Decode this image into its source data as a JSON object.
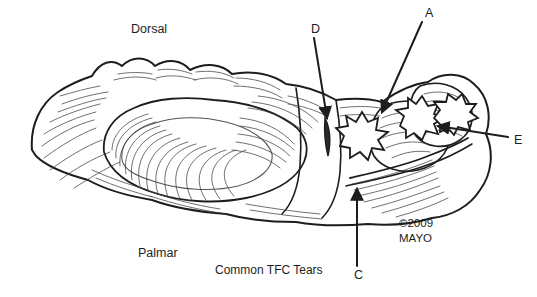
{
  "figure": {
    "kind": "medical-line-illustration",
    "caption": "Common TFC Tears",
    "background_color": "#ffffff",
    "ink_color": "#1d1d1d",
    "rule_color": "#9a9a9a"
  },
  "orientation_labels": [
    {
      "id": "dorsal",
      "text": "Dorsal",
      "x": 131,
      "y": 29
    },
    {
      "id": "palmar",
      "text": "Palmar",
      "x": 138,
      "y": 253
    }
  ],
  "caption": {
    "text": "Common TFC Tears",
    "x": 215,
    "y": 271
  },
  "credit": {
    "line1": "©2009",
    "line2": "MAYO",
    "x": 400,
    "y": 223
  },
  "callouts": [
    {
      "id": "A",
      "letter": "A",
      "label_x": 425,
      "label_y": 13,
      "leader": {
        "x1": 422,
        "y1": 22,
        "x2": 382,
        "y2": 112
      },
      "arrow": "down-left",
      "target": "central TFC perforation"
    },
    {
      "id": "C",
      "letter": "C",
      "label_x": 354,
      "label_y": 275,
      "leader": {
        "x1": 357,
        "y1": 266,
        "x2": 357,
        "y2": 189
      },
      "arrow": "up",
      "target": "palmar ulnocarpal ligament tear"
    },
    {
      "id": "D",
      "letter": "D",
      "label_x": 311,
      "label_y": 29,
      "leader": {
        "x1": 314,
        "y1": 38,
        "x2": 327,
        "y2": 118
      },
      "arrow": "down",
      "target": "radial-sided slit tear"
    },
    {
      "id": "E",
      "letter": "E",
      "label_x": 514,
      "label_y": 140,
      "leader": {
        "x1": 508,
        "y1": 137,
        "x2": 438,
        "y2": 126
      },
      "arrow": "left",
      "target": "ulnar-sided peripheral tear"
    }
  ],
  "tear_markers": [
    {
      "id": "tear-central",
      "shape": "star-burst",
      "cx": 366,
      "cy": 137
    },
    {
      "id": "tear-radial-slit",
      "shape": "slit",
      "cx": 328,
      "cy": 135
    },
    {
      "id": "tear-ulnar",
      "shape": "star-burst",
      "cx": 414,
      "cy": 124
    },
    {
      "id": "tear-peripheral",
      "shape": "star-burst",
      "cx": 444,
      "cy": 122
    }
  ]
}
